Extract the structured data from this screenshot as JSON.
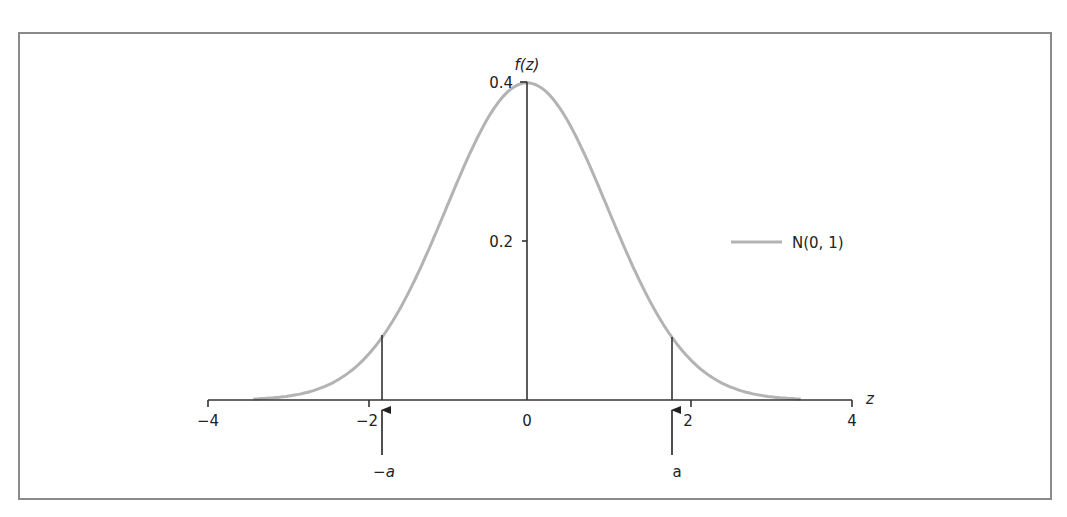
{
  "chart_data": {
    "type": "line",
    "title": "",
    "xlabel": "z",
    "ylabel": "f(z)",
    "xlim": [
      -4,
      4
    ],
    "ylim": [
      0,
      0.4
    ],
    "x_ticks": [
      -4,
      -2,
      0,
      2,
      4
    ],
    "x_tick_labels": [
      "−4",
      "−2",
      "0",
      "2",
      "4"
    ],
    "y_ticks": [
      0.2,
      0.4
    ],
    "y_tick_labels": [
      "0.2",
      "0.4"
    ],
    "grid": false,
    "legend_position": "right",
    "series": [
      {
        "name": "N(0, 1)",
        "color": "#b3b3b3",
        "function": "standard normal pdf",
        "x": [
          -3.4,
          -3,
          -2.5,
          -2,
          -1.8,
          -1.5,
          -1,
          -0.5,
          0,
          0.5,
          1,
          1.5,
          1.8,
          2,
          2.5,
          3,
          3.4
        ],
        "values": [
          0.0012,
          0.0044,
          0.0175,
          0.054,
          0.079,
          0.1295,
          0.242,
          0.352,
          0.399,
          0.352,
          0.242,
          0.1295,
          0.079,
          0.054,
          0.0175,
          0.0044,
          0.0012
        ]
      }
    ],
    "annotations": [
      {
        "label": "−a",
        "x": -1.8,
        "style": "italic",
        "marker": "vertical line to curve with upward arrow below axis"
      },
      {
        "label": "a",
        "x": 1.8,
        "style": "normal",
        "marker": "vertical line to curve with upward arrow below axis"
      }
    ]
  },
  "labels": {
    "y_axis": "f(z)",
    "x_axis": "z",
    "y_tick_04": "0.4",
    "y_tick_02": "0.2",
    "x_tick_m4": "−4",
    "x_tick_m2": "−2",
    "x_tick_0": "0",
    "x_tick_2": "2",
    "x_tick_4": "4",
    "legend": "N(0, 1)",
    "neg_a": "−a",
    "pos_a": "a"
  }
}
